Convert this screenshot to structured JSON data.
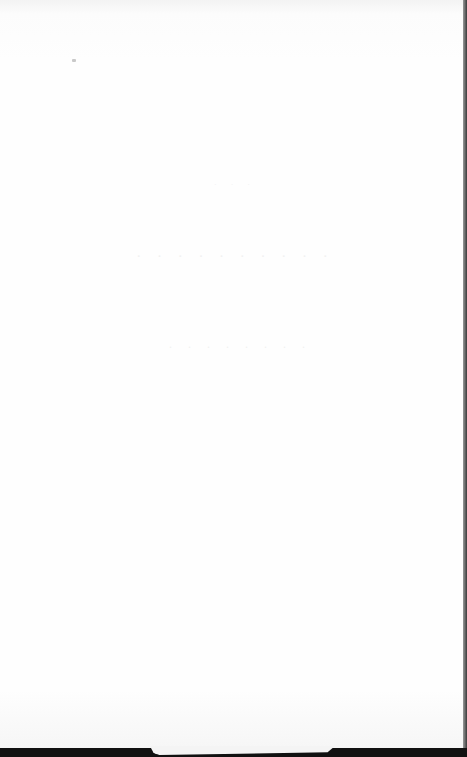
{
  "page": {
    "background": "#fdfdfd",
    "ghost_text": {
      "line1": "· · ·  · · · · · · ·",
      "line2": "· · · ·  · · · ·",
      "line3": "· · ·"
    }
  },
  "edges": {
    "right_edge_color": "#3a3a3a",
    "bottom_strip_color": "#111111"
  }
}
